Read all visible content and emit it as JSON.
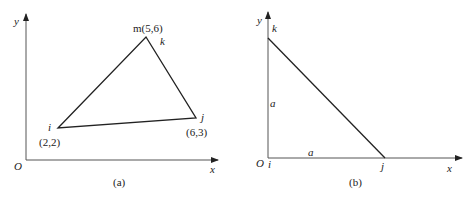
{
  "panel_a": {
    "caption": "(a)",
    "axes": {
      "x_label": "x",
      "y_label": "y",
      "origin_label": "O"
    },
    "vertices": {
      "i": {
        "name": "i",
        "coords": "(2,2)"
      },
      "j": {
        "name": "j",
        "coords": "(6,3)"
      },
      "m": {
        "name": "m",
        "coords": "m(5,6)",
        "alias": "k"
      }
    }
  },
  "panel_b": {
    "caption": "(b)",
    "axes": {
      "x_label": "x",
      "y_label": "y",
      "origin_label": "O"
    },
    "vertices": {
      "i": "i",
      "j": "j",
      "k": "k"
    },
    "side_labels": {
      "vertical": "a",
      "horizontal": "a"
    }
  }
}
